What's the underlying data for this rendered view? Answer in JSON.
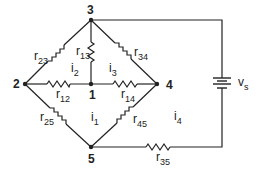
{
  "diagram": {
    "type": "circuit",
    "nodes": [
      {
        "id": "1",
        "label": "1"
      },
      {
        "id": "2",
        "label": "2"
      },
      {
        "id": "3",
        "label": "3"
      },
      {
        "id": "4",
        "label": "4"
      },
      {
        "id": "5",
        "label": "5"
      }
    ],
    "resistors": [
      {
        "name": "r",
        "sub": "12",
        "between": [
          "2",
          "1"
        ]
      },
      {
        "name": "r",
        "sub": "13",
        "between": [
          "1",
          "3"
        ]
      },
      {
        "name": "r",
        "sub": "14",
        "between": [
          "1",
          "4"
        ]
      },
      {
        "name": "r",
        "sub": "23",
        "between": [
          "2",
          "3"
        ]
      },
      {
        "name": "r",
        "sub": "25",
        "between": [
          "2",
          "5"
        ]
      },
      {
        "name": "r",
        "sub": "34",
        "between": [
          "3",
          "4"
        ]
      },
      {
        "name": "r",
        "sub": "35",
        "between": [
          "5",
          "3"
        ]
      },
      {
        "name": "r",
        "sub": "45",
        "between": [
          "4",
          "5"
        ]
      }
    ],
    "source": {
      "name": "v",
      "sub": "s"
    },
    "currents": [
      {
        "name": "i",
        "sub": "1"
      },
      {
        "name": "i",
        "sub": "2"
      },
      {
        "name": "i",
        "sub": "3"
      },
      {
        "name": "i",
        "sub": "4"
      }
    ],
    "colors": {
      "wire": "#222222",
      "background": "#ffffff"
    }
  }
}
